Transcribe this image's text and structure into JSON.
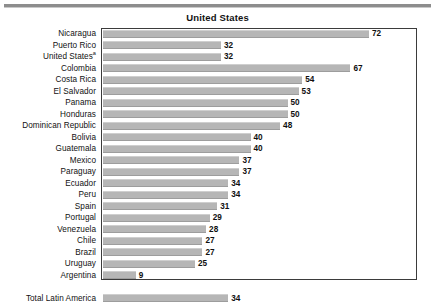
{
  "figure": {
    "title": "United States",
    "rule_color": "#8d8d8d",
    "bar_color": "#b6b6b6",
    "frame_color": "#3b3b3b"
  },
  "chart_data": {
    "type": "bar",
    "orientation": "horizontal",
    "title": "United States",
    "xlabel": "",
    "ylabel": "",
    "grid": false,
    "legend": null,
    "xlim": [
      0,
      80
    ],
    "value_labels": true,
    "categories": [
      "Nicaragua",
      "Puerto Rico",
      "United States",
      "Colombia",
      "Costa Rica",
      "El Salvador",
      "Panama",
      "Honduras",
      "Dominican Republic",
      "Bolivia",
      "Guatemala",
      "Mexico",
      "Paraguay",
      "Ecuador",
      "Peru",
      "Spain",
      "Portugal",
      "Venezuela",
      "Chile",
      "Brazil",
      "Uruguay",
      "Argentina",
      "Total Latin America"
    ],
    "values": [
      72,
      32,
      32,
      67,
      54,
      53,
      50,
      50,
      48,
      40,
      40,
      37,
      37,
      34,
      34,
      31,
      29,
      28,
      27,
      27,
      25,
      9,
      34
    ],
    "footnotes": {
      "United States": "a"
    }
  },
  "rows": [
    {
      "label": "Nicaragua",
      "value": 72,
      "footnote": ""
    },
    {
      "label": "Puerto Rico",
      "value": 32,
      "footnote": ""
    },
    {
      "label": "United States",
      "value": 32,
      "footnote": "a"
    },
    {
      "label": "Colombia",
      "value": 67,
      "footnote": ""
    },
    {
      "label": "Costa Rica",
      "value": 54,
      "footnote": ""
    },
    {
      "label": "El Salvador",
      "value": 53,
      "footnote": ""
    },
    {
      "label": "Panama",
      "value": 50,
      "footnote": ""
    },
    {
      "label": "Honduras",
      "value": 50,
      "footnote": ""
    },
    {
      "label": "Dominican Republic",
      "value": 48,
      "footnote": ""
    },
    {
      "label": "Bolivia",
      "value": 40,
      "footnote": ""
    },
    {
      "label": "Guatemala",
      "value": 40,
      "footnote": ""
    },
    {
      "label": "Mexico",
      "value": 37,
      "footnote": ""
    },
    {
      "label": "Paraguay",
      "value": 37,
      "footnote": ""
    },
    {
      "label": "Ecuador",
      "value": 34,
      "footnote": ""
    },
    {
      "label": "Peru",
      "value": 34,
      "footnote": ""
    },
    {
      "label": "Spain",
      "value": 31,
      "footnote": ""
    },
    {
      "label": "Portugal",
      "value": 29,
      "footnote": ""
    },
    {
      "label": "Venezuela",
      "value": 28,
      "footnote": ""
    },
    {
      "label": "Chile",
      "value": 27,
      "footnote": ""
    },
    {
      "label": "Brazil",
      "value": 27,
      "footnote": ""
    },
    {
      "label": "Uruguay",
      "value": 25,
      "footnote": ""
    },
    {
      "label": "Argentina",
      "value": 9,
      "footnote": ""
    },
    {
      "label": "Total Latin America",
      "value": 34,
      "footnote": ""
    }
  ]
}
